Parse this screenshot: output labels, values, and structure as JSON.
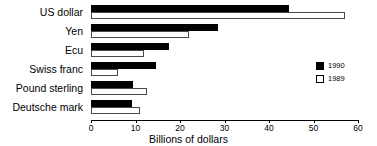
{
  "chart_data": {
    "type": "bar",
    "orientation": "horizontal",
    "title": "",
    "xlabel": "Billions of dollars",
    "ylabel": "",
    "xlim": [
      0,
      60
    ],
    "xticks": [
      0,
      10,
      20,
      30,
      40,
      50,
      60
    ],
    "grid": false,
    "legend_position": "right",
    "categories": [
      "US dollar",
      "Yen",
      "Ecu",
      "Swiss franc",
      "Pound sterling",
      "Deutsche mark"
    ],
    "series": [
      {
        "name": "1990",
        "color": "#000000",
        "values": [
          44.5,
          28.5,
          17.5,
          14.5,
          9.5,
          9.3
        ]
      },
      {
        "name": "1989",
        "color": "#ffffff",
        "values": [
          57,
          22,
          12,
          6,
          12.5,
          11
        ]
      }
    ]
  },
  "legend": {
    "entries": [
      {
        "label": "1990"
      },
      {
        "label": "1989"
      }
    ]
  }
}
